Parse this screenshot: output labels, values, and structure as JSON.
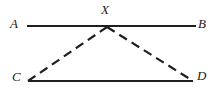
{
  "figure": {
    "type": "geometry-diagram",
    "width": 220,
    "height": 95,
    "background_color": "#ffffff",
    "stroke_color": "#1f1f1f",
    "labels": {
      "a": "A",
      "b": "B",
      "x": "X",
      "c": "C",
      "d": "D"
    },
    "segments": [
      {
        "name": "segment-ab",
        "style": "solid",
        "from": {
          "x": 27,
          "y": 26
        },
        "to": {
          "x": 196,
          "y": 26
        }
      },
      {
        "name": "segment-cd",
        "style": "solid",
        "from": {
          "x": 28,
          "y": 81
        },
        "to": {
          "x": 193,
          "y": 81
        }
      },
      {
        "name": "segment-cx",
        "style": "dashed",
        "from": {
          "x": 28,
          "y": 81
        },
        "to": {
          "x": 107,
          "y": 27
        }
      },
      {
        "name": "segment-xd",
        "style": "dashed",
        "from": {
          "x": 107,
          "y": 27
        },
        "to": {
          "x": 193,
          "y": 81
        }
      }
    ],
    "points": {
      "x_on_ab": {
        "x": 107,
        "y": 27
      }
    }
  }
}
